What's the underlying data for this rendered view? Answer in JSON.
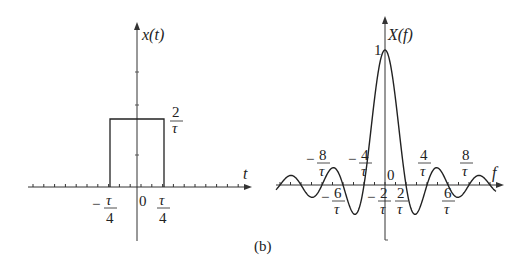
{
  "figure": {
    "caption": "(b)"
  },
  "left_plot": {
    "y_label": "x(t)",
    "x_label": "t",
    "origin_label": "0",
    "amplitude_label": {
      "num": "2",
      "den": "τ"
    },
    "left_edge_label": {
      "sign": "−",
      "num": "τ",
      "den": "4"
    },
    "right_edge_label": {
      "num": "τ",
      "den": "4"
    }
  },
  "right_plot": {
    "y_label": "X(f)",
    "x_label": "f",
    "origin_label": "0",
    "peak_label": "1",
    "tick_labels": [
      {
        "sign": "−",
        "num": "8",
        "den": "τ"
      },
      {
        "sign": "−",
        "num": "6",
        "den": "τ"
      },
      {
        "sign": "−",
        "num": "4",
        "den": "τ"
      },
      {
        "sign": "−",
        "num": "2",
        "den": "τ"
      },
      {
        "sign": "",
        "num": "2",
        "den": "τ"
      },
      {
        "sign": "",
        "num": "4",
        "den": "τ"
      },
      {
        "sign": "",
        "num": "6",
        "den": "τ"
      },
      {
        "sign": "",
        "num": "8",
        "den": "τ"
      }
    ]
  },
  "chart_data": [
    {
      "type": "line",
      "title": "x(t) rectangular pulse",
      "xlabel": "t",
      "ylabel": "x(t)",
      "x": [
        "-τ/4",
        "-τ/4",
        "τ/4",
        "τ/4"
      ],
      "values": [
        0,
        2,
        2,
        0
      ],
      "amplitude": "2/τ"
    },
    {
      "type": "line",
      "title": "X(f) sinc spectrum",
      "xlabel": "f",
      "ylabel": "X(f)",
      "peak": 1,
      "zero_crossings": [
        "-8/τ",
        "-6/τ",
        "-4/τ",
        "-2/τ",
        "2/τ",
        "4/τ",
        "6/τ",
        "8/τ"
      ],
      "function": "sinc(f·τ/2)"
    }
  ]
}
